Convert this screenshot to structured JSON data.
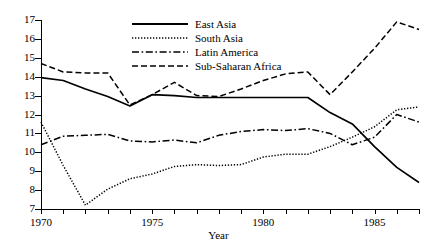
{
  "chart_data": {
    "type": "line",
    "title": "",
    "xlabel": "Year",
    "ylabel": "",
    "xlim": [
      1970,
      1987
    ],
    "ylim": [
      7,
      17
    ],
    "grid": false,
    "legend_position": "top-center",
    "x": [
      1970,
      1971,
      1972,
      1973,
      1974,
      1975,
      1976,
      1977,
      1978,
      1979,
      1980,
      1981,
      1982,
      1983,
      1984,
      1985,
      1986,
      1987
    ],
    "xticklabels": [
      "1970",
      "",
      "",
      "",
      "",
      "1975",
      "",
      "",
      "",
      "",
      "1980",
      "",
      "",
      "",
      "",
      "1985",
      "",
      ""
    ],
    "xtick_major": [
      "1970",
      "1975",
      "1980",
      "1985"
    ],
    "yticklabels": [
      "7",
      "8",
      "9",
      "10",
      "11",
      "12",
      "13",
      "14",
      "15",
      "16",
      "17"
    ],
    "series": [
      {
        "name": "East Asia",
        "style": "solid",
        "color": "#000000",
        "values": [
          13.95,
          13.8,
          13.35,
          12.95,
          12.45,
          13.05,
          13.0,
          12.9,
          12.9,
          12.9,
          12.9,
          12.9,
          12.9,
          12.1,
          11.5,
          10.3,
          9.2,
          8.4
        ]
      },
      {
        "name": "South Asia",
        "style": "dotted",
        "color": "#000000",
        "values": [
          11.6,
          9.3,
          7.2,
          8.05,
          8.6,
          8.85,
          9.25,
          9.35,
          9.3,
          9.35,
          9.75,
          9.9,
          9.9,
          10.3,
          10.8,
          11.35,
          12.25,
          12.4
        ]
      },
      {
        "name": "Latin America",
        "style": "dashdot",
        "color": "#000000",
        "values": [
          10.4,
          10.85,
          10.9,
          10.95,
          10.6,
          10.55,
          10.65,
          10.5,
          10.9,
          11.1,
          11.2,
          11.15,
          11.25,
          11.0,
          10.4,
          10.8,
          12.0,
          11.6
        ]
      },
      {
        "name": "Sub-Saharan Africa",
        "style": "dashed",
        "color": "#000000",
        "values": [
          14.7,
          14.25,
          14.2,
          14.2,
          12.5,
          13.05,
          13.7,
          13.0,
          12.95,
          13.35,
          13.8,
          14.15,
          14.25,
          13.05,
          14.25,
          15.5,
          16.9,
          16.5
        ]
      }
    ]
  }
}
